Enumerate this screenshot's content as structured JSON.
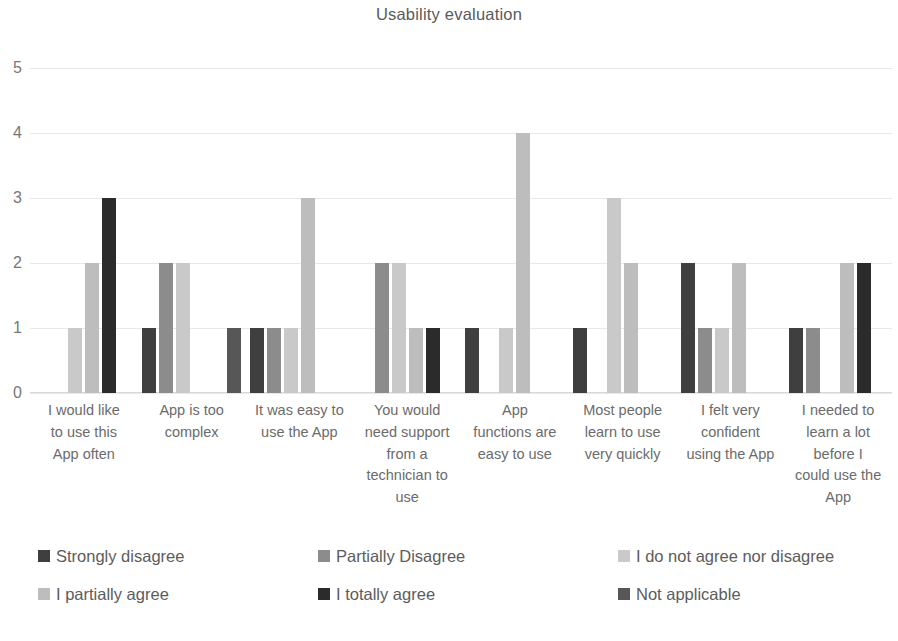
{
  "chart_data": {
    "type": "bar",
    "title": "Usability evaluation",
    "xlabel": "",
    "ylabel": "",
    "ylim": [
      0,
      5
    ],
    "ytick_labels": [
      "0",
      "1",
      "2",
      "3",
      "4",
      "5"
    ],
    "grid": true,
    "legend_position": "bottom",
    "categories": [
      "I would like to use this App often",
      "App is too complex",
      "It was easy to use the App",
      "You would need support from a technician to use",
      "App functions are easy to use",
      "Most people learn to use very quickly",
      "I felt very confident using the App",
      "I needed to learn a lot before I could use the App"
    ],
    "series": [
      {
        "name": "Strongly disagree",
        "color": "#3f3f3f",
        "values": [
          0,
          1,
          1,
          0,
          1,
          1,
          2,
          1
        ]
      },
      {
        "name": "Partially Disagree",
        "color": "#8c8c8c",
        "values": [
          0,
          2,
          1,
          2,
          0,
          0,
          1,
          1
        ]
      },
      {
        "name": "I do not agree nor disagree",
        "color": "#c9c9c9",
        "values": [
          1,
          2,
          1,
          2,
          1,
          3,
          1,
          0
        ]
      },
      {
        "name": "I partially agree",
        "color": "#bdbdbd",
        "values": [
          2,
          0,
          3,
          1,
          4,
          2,
          2,
          2
        ]
      },
      {
        "name": "I totally agree",
        "color": "#2b2b2b",
        "values": [
          3,
          0,
          0,
          1,
          0,
          0,
          0,
          2
        ]
      },
      {
        "name": "Not applicable",
        "color": "#575757",
        "values": [
          0,
          1,
          0,
          0,
          0,
          0,
          0,
          0
        ]
      }
    ]
  },
  "legend": {
    "items": [
      {
        "label": "Strongly disagree",
        "color": "#3f3f3f"
      },
      {
        "label": "Partially Disagree",
        "color": "#8c8c8c"
      },
      {
        "label": "I do not agree nor disagree",
        "color": "#c9c9c9"
      },
      {
        "label": "I partially agree",
        "color": "#bdbdbd"
      },
      {
        "label": "I totally agree",
        "color": "#2b2b2b"
      },
      {
        "label": "Not applicable",
        "color": "#575757"
      }
    ]
  },
  "layout": {
    "category_label_lines": [
      [
        "I would like",
        "to use this",
        "App often"
      ],
      [
        "App is too",
        "complex"
      ],
      [
        "It was easy to",
        "use the App"
      ],
      [
        "You would",
        "need support",
        "from a",
        "technician to",
        "use"
      ],
      [
        "App",
        "functions are",
        "easy to use"
      ],
      [
        "Most people",
        "learn to use",
        "very quickly"
      ],
      [
        "I felt very",
        "confident",
        "using the App"
      ],
      [
        "I needed to",
        "learn a lot",
        "before I",
        "could use the",
        "App"
      ]
    ]
  }
}
